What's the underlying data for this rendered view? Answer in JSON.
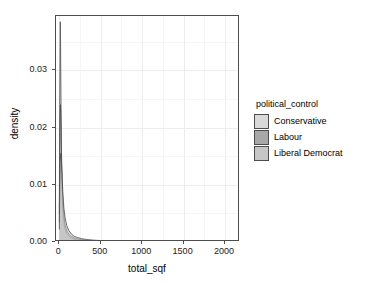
{
  "chart_data": {
    "type": "area",
    "title": "",
    "subtitle": "",
    "xlabel": "total_sqf",
    "ylabel": "density",
    "xlim": [
      -40,
      2180
    ],
    "ylim": [
      0,
      0.0395
    ],
    "grid": true,
    "legend_position": "right",
    "legend_title": "political_control",
    "x_ticks": [
      0,
      500,
      1000,
      1500,
      2000
    ],
    "x_tick_labels": [
      "0",
      "500",
      "1000",
      "1500",
      "2000"
    ],
    "y_ticks": [
      0.0,
      0.01,
      0.02,
      0.03
    ],
    "y_tick_labels": [
      "0.00",
      "0.01",
      "0.02",
      "0.03"
    ],
    "series": [
      {
        "name": "Conservative",
        "color": "#d9d9d9",
        "line_color": "#4d4d4d",
        "peak_x": 12,
        "peak_y": 0.0385,
        "x": [
          0,
          5,
          10,
          12,
          15,
          20,
          25,
          30,
          40,
          50,
          60,
          75,
          90,
          110,
          130,
          150,
          175,
          200,
          230,
          260,
          300,
          350,
          400,
          500,
          600,
          800,
          1000,
          1250,
          1500,
          1750,
          2000,
          2150
        ],
        "y": [
          0.005,
          0.024,
          0.036,
          0.0385,
          0.035,
          0.025,
          0.0165,
          0.0115,
          0.0062,
          0.004,
          0.0029,
          0.002,
          0.0015,
          0.0011,
          0.00085,
          0.00068,
          0.00052,
          0.00042,
          0.00033,
          0.00027,
          0.00021,
          0.00016,
          0.00013,
          9e-05,
          7e-05,
          5e-05,
          4e-05,
          3e-05,
          2e-05,
          2e-05,
          1e-05,
          1e-05
        ]
      },
      {
        "name": "Labour",
        "color": "#a8a8a8",
        "line_color": "#4d4d4d",
        "peak_x": 14,
        "peak_y": 0.024,
        "x": [
          0,
          5,
          10,
          14,
          18,
          24,
          30,
          40,
          50,
          65,
          80,
          100,
          125,
          150,
          180,
          210,
          250,
          300,
          360,
          430,
          520,
          650,
          800,
          1000,
          1250,
          1500,
          1750,
          2000,
          2150
        ],
        "y": [
          0.0035,
          0.015,
          0.022,
          0.024,
          0.0225,
          0.0175,
          0.013,
          0.008,
          0.0054,
          0.0034,
          0.0024,
          0.0017,
          0.0012,
          0.00095,
          0.00072,
          0.00058,
          0.00045,
          0.00034,
          0.00026,
          0.0002,
          0.00015,
          0.00011,
          8e-05,
          6e-05,
          4e-05,
          3e-05,
          2e-05,
          2e-05,
          1e-05
        ]
      },
      {
        "name": "Liberal Democrat",
        "color": "#c6c6c6",
        "line_color": "#4d4d4d",
        "peak_x": 18,
        "peak_y": 0.0155,
        "x": [
          0,
          5,
          10,
          18,
          25,
          32,
          42,
          55,
          70,
          90,
          115,
          145,
          180,
          220,
          270,
          330,
          400,
          500,
          620,
          780,
          1000,
          1250,
          1500,
          1750,
          2000,
          2150
        ],
        "y": [
          0.0022,
          0.0095,
          0.014,
          0.0155,
          0.014,
          0.0118,
          0.0088,
          0.006,
          0.0042,
          0.0029,
          0.002,
          0.0014,
          0.001,
          0.00078,
          0.00058,
          0.00044,
          0.00034,
          0.00025,
          0.00019,
          0.00014,
          0.0001,
          7e-05,
          5e-05,
          4e-05,
          3e-05,
          2e-05
        ]
      }
    ]
  },
  "legend": {
    "title": "political_control",
    "items": [
      {
        "label": "Conservative",
        "color": "#d9d9d9"
      },
      {
        "label": "Labour",
        "color": "#a8a8a8"
      },
      {
        "label": "Liberal Democrat",
        "color": "#c6c6c6"
      }
    ]
  },
  "axes": {
    "x_title": "total_sqf",
    "y_title": "density"
  }
}
